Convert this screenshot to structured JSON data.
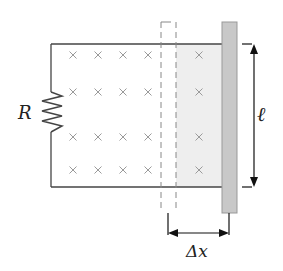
{
  "diagram": {
    "labels": {
      "resistor": "R",
      "length": "ℓ",
      "displacement": "Δx"
    },
    "field_symbol": "×",
    "field_direction": "into page",
    "field_grid": {
      "columns_x": [
        73,
        98,
        123,
        148,
        199
      ],
      "rows_y": [
        55,
        92,
        137,
        170
      ]
    },
    "colors": {
      "wire": "#444444",
      "field_mark": "#9a9a9a",
      "shaded_area": "#eeeeee",
      "bar_fill": "#c8c8c8",
      "bar_stroke": "#999999",
      "dashed_bar": "#888888",
      "arrow": "#111111"
    }
  }
}
